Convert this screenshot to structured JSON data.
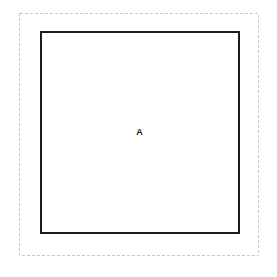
{
  "canvas": {
    "width": 277,
    "height": 277,
    "background_color": "#ffffff"
  },
  "outer_frame": {
    "name": "bounding-frame",
    "style": "dashed",
    "stroke_color": "#c9c9c9",
    "stroke_width": 1,
    "dash_length": 3,
    "gap_length": 2,
    "x": 19,
    "y": 13,
    "width": 240,
    "height": 243
  },
  "region": {
    "label": "A",
    "name": "region-a",
    "stroke_color": "#1c1c1c",
    "stroke_width": 1.6,
    "fill_color": "#ffffff",
    "x": 41,
    "y": 32,
    "width": 197,
    "height": 200
  },
  "label_style": {
    "color": "#1c1c1c",
    "font_size": 9,
    "weight": "bold"
  }
}
